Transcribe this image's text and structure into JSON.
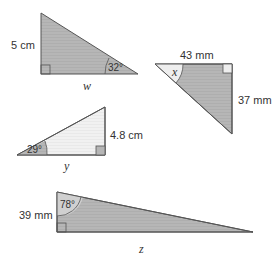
{
  "colors": {
    "fill_dark": "#b4b4b4",
    "fill_light": "#eeeeee",
    "stroke": "#555555",
    "text": "#333333"
  },
  "triangles": [
    {
      "id": "t1",
      "side_label": "5 cm",
      "angle_label": "32°",
      "unknown_label": "w"
    },
    {
      "id": "t2",
      "top_label": "43 mm",
      "side_label": "37 mm",
      "unknown_label": "x"
    },
    {
      "id": "t3",
      "side_label": "4.8 cm",
      "angle_label": "29°",
      "unknown_label": "y"
    },
    {
      "id": "t4",
      "side_label": "39 mm",
      "angle_label": "78°",
      "unknown_label": "z"
    }
  ]
}
